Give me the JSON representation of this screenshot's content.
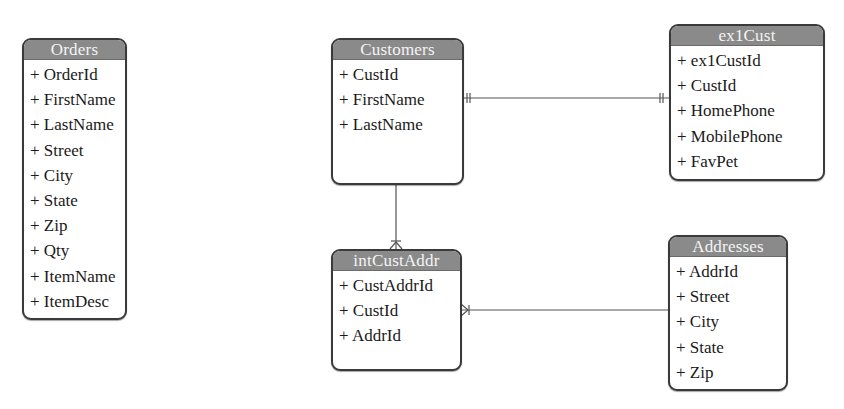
{
  "diagram": {
    "type": "entity-relationship",
    "entities": [
      {
        "id": "orders",
        "name": "Orders",
        "attributes": [
          "+ OrderId",
          "+ FirstName",
          "+ LastName",
          "+ Street",
          "+ City",
          "+ State",
          "+ Zip",
          "+ Qty",
          "+ ItemName",
          "+ ItemDesc"
        ]
      },
      {
        "id": "customers",
        "name": "Customers",
        "attributes": [
          "+ CustId",
          "+ FirstName",
          "+ LastName"
        ]
      },
      {
        "id": "ex1cust",
        "name": "ex1Cust",
        "attributes": [
          "+ ex1CustId",
          "+ CustId",
          "+ HomePhone",
          "+ MobilePhone",
          "+ FavPet"
        ]
      },
      {
        "id": "intcustaddr",
        "name": "intCustAddr",
        "attributes": [
          "+ CustAddrId",
          "+ CustId",
          "+ AddrId"
        ]
      },
      {
        "id": "addresses",
        "name": "Addresses",
        "attributes": [
          "+ AddrId",
          "+ Street",
          "+ City",
          "+ State",
          "+ Zip"
        ]
      }
    ],
    "relationships": [
      {
        "from": "Customers",
        "to": "ex1Cust",
        "from_cardinality": "one-and-only-one",
        "to_cardinality": "one-and-only-one"
      },
      {
        "from": "Customers",
        "to": "intCustAddr",
        "from_cardinality": "one",
        "to_cardinality": "many"
      },
      {
        "from": "Addresses",
        "to": "intCustAddr",
        "from_cardinality": "one",
        "to_cardinality": "many"
      }
    ],
    "colors": {
      "header_bg": "#8a8a8a",
      "header_text": "#f4f4f4",
      "border": "#3a3a3a",
      "line": "#555555"
    }
  }
}
